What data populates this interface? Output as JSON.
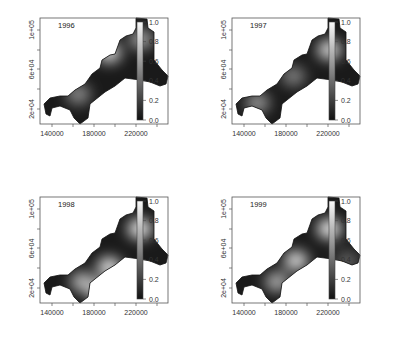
{
  "chart_data": [
    {
      "type": "heatmap",
      "title": "1996",
      "x_ticks": [
        "140000",
        "180000",
        "220000"
      ],
      "y_ticks": [
        "2e+04",
        "6e+04",
        "1e+05"
      ],
      "colorbar_ticks": [
        "0.0",
        "0.2",
        "0.4",
        "0.6",
        "0.8",
        "1.0"
      ],
      "zlim": [
        0,
        1
      ],
      "colormap": "grayscale (black=0, white=1)",
      "hotspots": [
        {
          "x": 0.54,
          "y": 0.33,
          "v": 0.85
        },
        {
          "x": 0.3,
          "y": 0.72,
          "v": 0.5
        },
        {
          "x": 0.79,
          "y": 0.2,
          "v": 0.6
        }
      ]
    },
    {
      "type": "heatmap",
      "title": "1997",
      "x_ticks": [
        "140000",
        "180000",
        "220000"
      ],
      "y_ticks": [
        "2e+04",
        "6e+04",
        "1e+05"
      ],
      "colorbar_ticks": [
        "0.0",
        "0.2",
        "0.4",
        "0.6",
        "0.8",
        "1.0"
      ],
      "zlim": [
        0,
        1
      ],
      "colormap": "grayscale (black=0, white=1)",
      "hotspots": [
        {
          "x": 0.76,
          "y": 0.3,
          "v": 0.85
        },
        {
          "x": 0.2,
          "y": 0.8,
          "v": 0.55
        },
        {
          "x": 0.48,
          "y": 0.55,
          "v": 0.45
        }
      ]
    },
    {
      "type": "heatmap",
      "title": "1998",
      "x_ticks": [
        "140000",
        "180000",
        "220000"
      ],
      "y_ticks": [
        "2e+04",
        "6e+04",
        "1e+05"
      ],
      "colorbar_ticks": [
        "0.0",
        "0.2",
        "0.4",
        "0.6",
        "0.8",
        "1.0"
      ],
      "zlim": [
        0,
        1
      ],
      "colormap": "grayscale (black=0, white=1)",
      "hotspots": [
        {
          "x": 0.78,
          "y": 0.3,
          "v": 0.95
        },
        {
          "x": 0.54,
          "y": 0.66,
          "v": 0.9
        },
        {
          "x": 0.33,
          "y": 0.8,
          "v": 0.7
        },
        {
          "x": 0.45,
          "y": 0.88,
          "v": 0.75
        }
      ]
    },
    {
      "type": "heatmap",
      "title": "1999",
      "x_ticks": [
        "140000",
        "180000",
        "220000"
      ],
      "y_ticks": [
        "2e+04",
        "6e+04",
        "1e+05"
      ],
      "colorbar_ticks": [
        "0.0",
        "0.2",
        "0.4",
        "0.6",
        "0.8",
        "1.0"
      ],
      "zlim": [
        0,
        1
      ],
      "colormap": "grayscale (black=0, white=1)",
      "hotspots": [
        {
          "x": 0.76,
          "y": 0.3,
          "v": 0.95
        },
        {
          "x": 0.5,
          "y": 0.6,
          "v": 0.85
        },
        {
          "x": 0.35,
          "y": 0.8,
          "v": 0.65
        },
        {
          "x": 0.9,
          "y": 0.6,
          "v": 0.3
        }
      ]
    }
  ],
  "panels": [
    {
      "year": "1996",
      "x": 0,
      "y": 0
    },
    {
      "year": "1997",
      "x": 192,
      "y": 0
    },
    {
      "year": "1998",
      "x": 0,
      "y": 179
    },
    {
      "year": "1999",
      "x": 192,
      "y": 179
    }
  ]
}
